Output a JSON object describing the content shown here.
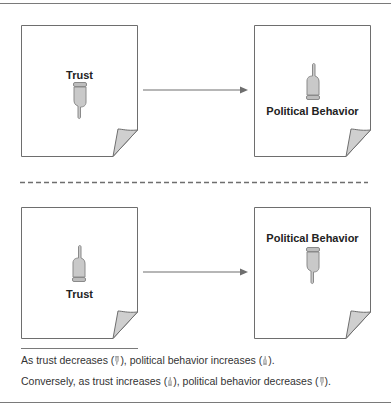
{
  "colors": {
    "border": "#7a7a7a",
    "page_stroke": "#6e6e6e",
    "hand_fill": "#c9c9c9",
    "hand_stroke": "#8a8a8a",
    "curl_fill": "#cfcfcf",
    "text": "#222222"
  },
  "top_panel": {
    "left_page": {
      "label": "Trust",
      "hand": "pointing-down"
    },
    "right_page": {
      "label": "Political Behavior",
      "hand": "pointing-up"
    },
    "arrow": "right-arrow"
  },
  "divider": "dashed-line",
  "bottom_panel": {
    "left_page": {
      "label": "Trust",
      "hand": "pointing-up"
    },
    "right_page": {
      "label": "Political Behavior",
      "hand": "pointing-down"
    },
    "arrow": "right-arrow"
  },
  "caption": {
    "line1": {
      "pre": "As trust decreases (",
      "mid": "), political behavior increases (",
      "post": ")."
    },
    "line2": {
      "pre": "Conversely, as trust increases (",
      "mid": "), political behavior decreases (",
      "post": ")."
    }
  }
}
